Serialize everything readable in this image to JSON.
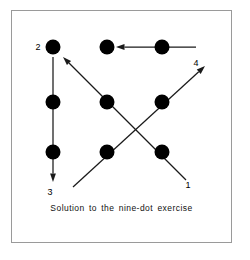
{
  "figure": {
    "caption": "Solution to the nine-dot exercise",
    "frame": {
      "border_color": "#9a9a9a",
      "background": "#ffffff"
    },
    "dot_color": "#000000",
    "line_color": "#1a1a1a"
  },
  "chart_data": {
    "type": "diagram",
    "title": "Solution to the nine-dot exercise",
    "xlabel": "",
    "ylabel": "",
    "grid": false,
    "legend": "none",
    "dot_radius": 7.5,
    "dots": [
      {
        "id": "r1c1",
        "row": 1,
        "col": 1,
        "x": 53,
        "y": 47
      },
      {
        "id": "r1c2",
        "row": 1,
        "col": 2,
        "x": 107,
        "y": 47
      },
      {
        "id": "r1c3",
        "row": 1,
        "col": 3,
        "x": 162,
        "y": 47
      },
      {
        "id": "r2c1",
        "row": 2,
        "col": 1,
        "x": 53,
        "y": 102
      },
      {
        "id": "r2c2",
        "row": 2,
        "col": 2,
        "x": 107,
        "y": 102
      },
      {
        "id": "r2c3",
        "row": 2,
        "col": 3,
        "x": 162,
        "y": 102
      },
      {
        "id": "r3c1",
        "row": 3,
        "col": 1,
        "x": 53,
        "y": 152
      },
      {
        "id": "r3c2",
        "row": 3,
        "col": 2,
        "x": 107,
        "y": 152
      },
      {
        "id": "r3c3",
        "row": 3,
        "col": 3,
        "x": 162,
        "y": 152
      }
    ],
    "segments": [
      {
        "order": 1,
        "label": "1",
        "from": {
          "x": 186,
          "y": 180
        },
        "to": {
          "x": 63,
          "y": 57
        },
        "arrow": true,
        "direction": "up-left",
        "label_pos": {
          "x": 188,
          "y": 188
        }
      },
      {
        "order": 2,
        "label": "2",
        "from": {
          "x": 53,
          "y": 57
        },
        "to": {
          "x": 53,
          "y": 182
        },
        "arrow": true,
        "direction": "down",
        "label_pos": {
          "x": 38,
          "y": 50
        }
      },
      {
        "order": 3,
        "label": "3",
        "from": {
          "x": 73,
          "y": 187
        },
        "to": {
          "x": 205,
          "y": 66
        },
        "arrow": true,
        "direction": "up-right",
        "label_pos": {
          "x": 50,
          "y": 195
        }
      },
      {
        "order": 4,
        "label": "4",
        "from": {
          "x": 196,
          "y": 47
        },
        "to": {
          "x": 116,
          "y": 47
        },
        "arrow": true,
        "direction": "left",
        "label_pos": {
          "x": 196,
          "y": 66
        }
      }
    ],
    "labels": [
      {
        "text": "1",
        "x": 188,
        "y": 188
      },
      {
        "text": "2",
        "x": 38,
        "y": 50
      },
      {
        "text": "3",
        "x": 50,
        "y": 195
      },
      {
        "text": "4",
        "x": 196,
        "y": 66
      }
    ]
  }
}
